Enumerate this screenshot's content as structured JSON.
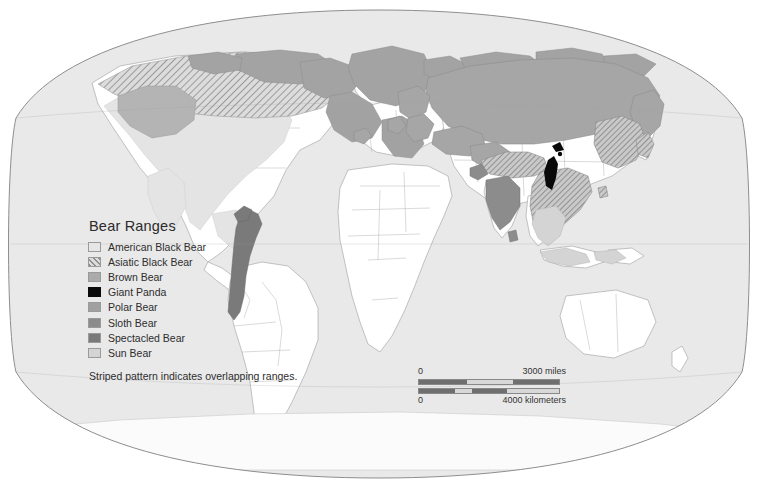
{
  "map": {
    "title": "Bear Ranges World Map",
    "projection": "winkel-tripel",
    "ocean_color": "#e8e8e8",
    "land_color": "#ffffff",
    "border_color": "#9b9b9b",
    "graticule_color": "#8e8e8e"
  },
  "legend": {
    "title": "Bear Ranges",
    "note": "Striped pattern indicates overlapping ranges.",
    "items": [
      {
        "label": "American Black Bear",
        "color": "#e6e6e6",
        "pattern": "solid"
      },
      {
        "label": "Asiatic Black Bear",
        "color": "#b9b9b9",
        "pattern": "hatch"
      },
      {
        "label": "Brown Bear",
        "color": "#a8a8a8",
        "pattern": "solid"
      },
      {
        "label": "Giant Panda",
        "color": "#0a0a0a",
        "pattern": "solid"
      },
      {
        "label": "Polar Bear",
        "color": "#9e9e9e",
        "pattern": "solid"
      },
      {
        "label": "Sloth Bear",
        "color": "#8a8a8a",
        "pattern": "solid"
      },
      {
        "label": "Spectacled Bear",
        "color": "#7b7b7b",
        "pattern": "solid"
      },
      {
        "label": "Sun Bear",
        "color": "#d2d2d2",
        "pattern": "solid"
      }
    ]
  },
  "scalebar": {
    "miles_zero": "0",
    "miles_max": "3000 miles",
    "km_zero": "0",
    "km_max": "4000 kilometers",
    "bar_color": "#6f6f6f",
    "alt_color": "#d8d8d8"
  }
}
